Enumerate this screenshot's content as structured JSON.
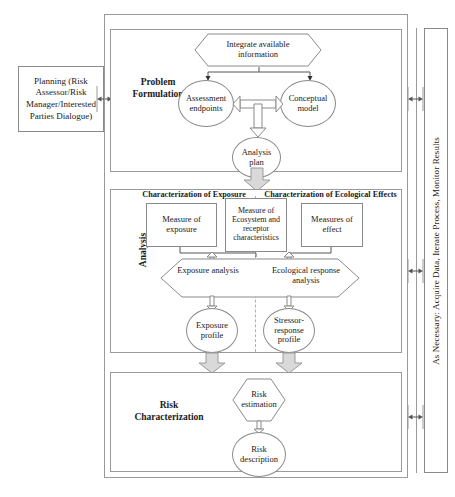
{
  "diagram": {
    "side_panel": {
      "label": "As Necessary: Acquire Data, Iterate Process, Monitor Results"
    },
    "planning": {
      "label": "Planning (Risk Assessor/Risk Manager/Interested Parties Dialogue)"
    },
    "sections": [
      {
        "id": "problem-formulation",
        "label": "Problem\nFormulation"
      },
      {
        "id": "analysis",
        "label": "Analysis"
      },
      {
        "id": "risk-characterization",
        "label": "Risk\nCharacterization"
      }
    ],
    "problem_formulation": {
      "title_line1": "Problem",
      "title_line2": "Formulation",
      "integrate": "Integrate available information",
      "assessment_endpoints": "Assessment endpoints",
      "conceptual_model": "Conceptual model",
      "analysis_plan": "Analysis plan"
    },
    "analysis": {
      "title": "Analysis",
      "header_left": "Characterization of Exposure",
      "header_right": "Characterization of Ecological Effects",
      "measure_exposure": "Measure of exposure",
      "measure_ecosystem": "Measure of Ecosystem and receptor characteristics",
      "measures_effect": "Measures of effect",
      "exposure_analysis": "Exposure analysis",
      "ecological_response_analysis": "Ecological response analysis",
      "exposure_profile": "Exposure profile",
      "stressor_response_profile": "Stressor-response profile"
    },
    "risk_characterization": {
      "title_line1": "Risk",
      "title_line2": "Characterization",
      "risk_estimation": "Risk estimation",
      "risk_description": "Risk description"
    },
    "colors": {
      "stroke": "#8a8a8a",
      "frame": "#9a9a9a",
      "arrow_fill": "#d9d9d9",
      "divider": "#b0b0b0",
      "text": "#1a1a1a",
      "background": "#ffffff"
    }
  }
}
